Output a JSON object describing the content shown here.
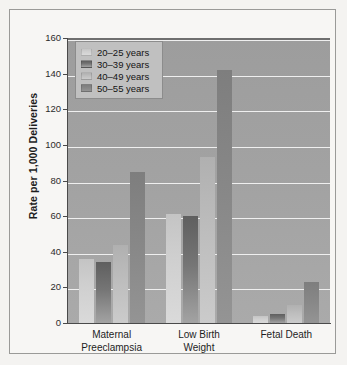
{
  "chart_data": {
    "type": "bar",
    "title": "",
    "xlabel": "",
    "ylabel": "Rate per 1,000 Deliveries",
    "ylim": [
      0,
      160
    ],
    "yticks": [
      0,
      20,
      40,
      60,
      80,
      100,
      120,
      140,
      160
    ],
    "ytick_labels": [
      "0",
      "20",
      "40",
      "60",
      "80",
      "100",
      "120",
      "140",
      "160"
    ],
    "grid": true,
    "legend_position": "upper-left",
    "categories": [
      "Maternal Preeclampsia",
      "Low Birth Weight",
      "Fetal Death"
    ],
    "category_lines": [
      [
        "Maternal",
        "Preeclampsia"
      ],
      [
        "Low Birth",
        "Weight"
      ],
      [
        "Fetal Death",
        ""
      ]
    ],
    "series": [
      {
        "name": "20–25 years",
        "color": "#cfcfcf",
        "values": [
          36,
          61,
          4
        ]
      },
      {
        "name": "30–39 years",
        "color": "#6e6e6e",
        "values": [
          34,
          60,
          5
        ]
      },
      {
        "name": "40–49 years",
        "color": "#bdbdbd",
        "values": [
          44,
          93,
          10
        ]
      },
      {
        "name": "50–55 years",
        "color": "#888888",
        "values": [
          85,
          142,
          23
        ]
      }
    ]
  },
  "colors": {
    "plot_background": "#a3a3a3",
    "gridline": "#efefef",
    "axis": "#4a4a4a",
    "figure_background": "#f7f6f4",
    "frame_border": "#9a9a98",
    "legend_background": "#c0c0c0",
    "legend_border": "#8c8c8c"
  }
}
